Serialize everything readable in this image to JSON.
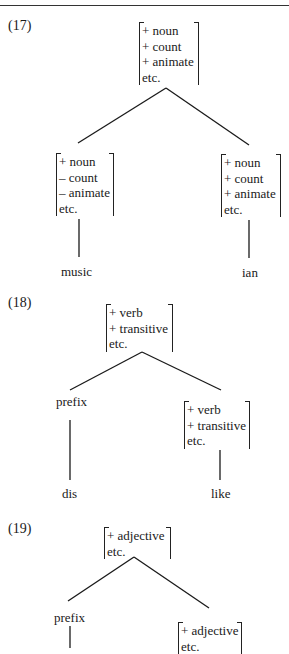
{
  "examples": [
    {
      "label": "(17)",
      "root": {
        "features": [
          "+ noun",
          "+ count",
          "+ animate",
          "etc."
        ]
      },
      "left": {
        "features": [
          "+ noun",
          "– count",
          "– animate",
          "etc."
        ],
        "word": "music"
      },
      "right": {
        "features": [
          "+ noun",
          "+ count",
          "+ animate",
          "etc."
        ],
        "word": "ian"
      }
    },
    {
      "label": "(18)",
      "root": {
        "features": [
          "+ verb",
          "+ transitive",
          "etc."
        ]
      },
      "left": {
        "node": "prefix",
        "word": "dis"
      },
      "right": {
        "features": [
          "+ verb",
          "+ transitive",
          "etc."
        ],
        "word": "like"
      }
    },
    {
      "label": "(19)",
      "root": {
        "features": [
          "+ adjective",
          "etc."
        ]
      },
      "left": {
        "node": "prefix"
      },
      "right": {
        "features": [
          "+ adjective",
          "etc."
        ]
      }
    }
  ]
}
